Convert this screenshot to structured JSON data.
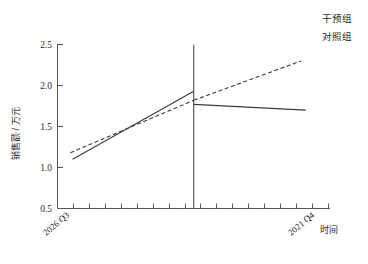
{
  "chart_data": {
    "type": "line",
    "title": "",
    "subtitle": "",
    "xlabel": "时间",
    "ylabel": "销售额 / 万元",
    "xlim": [
      0,
      18
    ],
    "ylim": [
      0.5,
      2.5
    ],
    "yticks": [
      "0.5",
      "1.0",
      "1.5",
      "2.0",
      "2.5"
    ],
    "ytick_values": [
      0.5,
      1.0,
      1.5,
      2.0,
      2.5
    ],
    "x_category_labels": [
      "2026 Q3",
      "2021 Q4"
    ],
    "x_category_positions": [
      1,
      16
    ],
    "x_minor_tick_count": 17,
    "grid": false,
    "legend_position": "top-right",
    "legend_entries": [
      "干预组",
      "对照组"
    ],
    "intervention": {
      "label": "",
      "x_value": 9.0,
      "line_style": "solid"
    },
    "series": [
      {
        "name": "干预组",
        "style": "solid",
        "segments": [
          {
            "phase": "pre",
            "x": [
              1.0,
              9.0
            ],
            "y": [
              1.1,
              1.93
            ]
          },
          {
            "phase": "post",
            "x": [
              9.0,
              16.4
            ],
            "y": [
              1.77,
              1.7
            ]
          }
        ]
      },
      {
        "name": "对照组",
        "style": "dashed",
        "segments": [
          {
            "phase": "pre",
            "x": [
              0.85,
              9.0
            ],
            "y": [
              1.18,
              1.82
            ]
          },
          {
            "phase": "post",
            "x": [
              9.0,
              16.1
            ],
            "y": [
              1.82,
              2.3
            ]
          }
        ]
      }
    ]
  },
  "axis": {
    "ylabel": "销售额 / 万元",
    "xlabel": "时间",
    "ytick_labels": [
      "2.5",
      "2.0",
      "1.5",
      "1.0",
      "0.5"
    ],
    "xcat_left": "2026 Q3",
    "xcat_right": "2021 Q4"
  },
  "legend": {
    "entry_1": "干预组",
    "entry_2": "对照组"
  }
}
